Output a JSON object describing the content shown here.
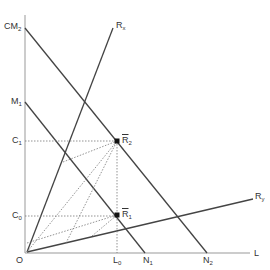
{
  "diagram": {
    "labels": {
      "cm2": "CM",
      "cm2_sub": "2",
      "m1": "M",
      "m1_sub": "1",
      "c1": "C",
      "c1_sub": "1",
      "c0": "C",
      "c0_sub": "0",
      "origin": "O",
      "l0": "L",
      "l0_sub": "0",
      "n1": "N",
      "n1_sub": "1",
      "n2": "N",
      "n2_sub": "2",
      "l_axis": "L",
      "rx": "R",
      "rx_sub": "x",
      "ry": "R",
      "ry_sub": "y",
      "r2": "R",
      "r2_sub": "2",
      "r1": "R",
      "r1_sub": "1"
    },
    "points": {
      "O": [
        27,
        252
      ],
      "CM2": [
        25,
        28
      ],
      "M1": [
        25,
        102
      ],
      "R2": [
        117,
        141
      ],
      "R1": [
        117,
        215
      ],
      "N1": [
        145,
        252
      ],
      "N2": [
        207,
        252
      ],
      "Rx_end": [
        113,
        28
      ],
      "Ry_end": [
        253,
        199
      ]
    }
  }
}
